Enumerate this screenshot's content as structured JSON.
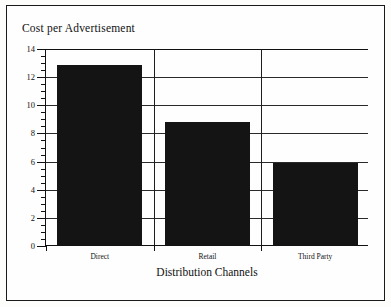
{
  "chart_data": {
    "type": "bar",
    "title": "Cost per Advertisement",
    "xlabel": "Distribution Channels",
    "ylabel": "Cost per Advertisement",
    "categories": [
      "Direct",
      "Retail",
      "Third Party"
    ],
    "values": [
      12.8,
      8.75,
      5.85
    ],
    "ylim": [
      0,
      14
    ],
    "ytick_labels": [
      "0",
      "2",
      "4",
      "6",
      "8",
      "10",
      "12",
      "14"
    ],
    "ytick_values": [
      0,
      2,
      4,
      6,
      8,
      10,
      12,
      14
    ],
    "yminor_step": 0.5,
    "grid": "horizontal-and-category-dividers",
    "legend": "none",
    "bar_color": "#141414",
    "frame_color": "#1a1a1a",
    "series": [
      {
        "name": "Cost per Advertisement",
        "values": [
          12.8,
          8.75,
          5.85
        ]
      }
    ]
  }
}
